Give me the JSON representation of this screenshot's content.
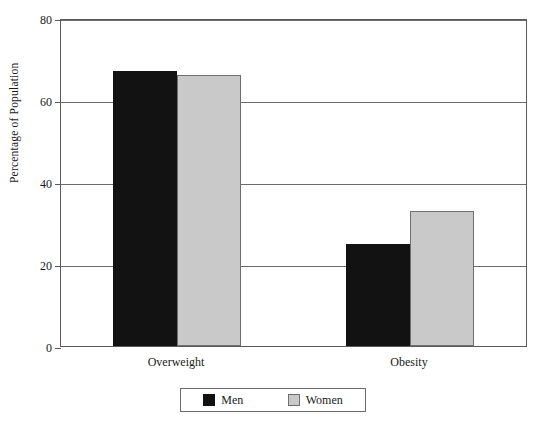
{
  "chart_data": {
    "type": "bar",
    "title": "",
    "subtitle": "",
    "xlabel": "",
    "ylabel": "Percentage of Population",
    "ylim": [
      0,
      80
    ],
    "yticks": [
      0,
      20,
      40,
      60,
      80
    ],
    "ytick_labels": [
      "0",
      "20",
      "40",
      "60",
      "80"
    ],
    "grid": true,
    "grid_axis": "y",
    "legend_position": "bottom-center",
    "categories": [
      "Overweight",
      "Obesity"
    ],
    "series": [
      {
        "name": "Men",
        "color": "#121212",
        "values": [
          67,
          25
        ]
      },
      {
        "name": "Women",
        "color": "#c9c9c9",
        "values": [
          66,
          33
        ]
      }
    ]
  },
  "colors": {
    "men": "#121212",
    "women": "#c9c9c9",
    "axis": "#5a5a5a",
    "grid": "#6b6b6b",
    "background": "#ffffff",
    "text": "#1a1a1a"
  }
}
